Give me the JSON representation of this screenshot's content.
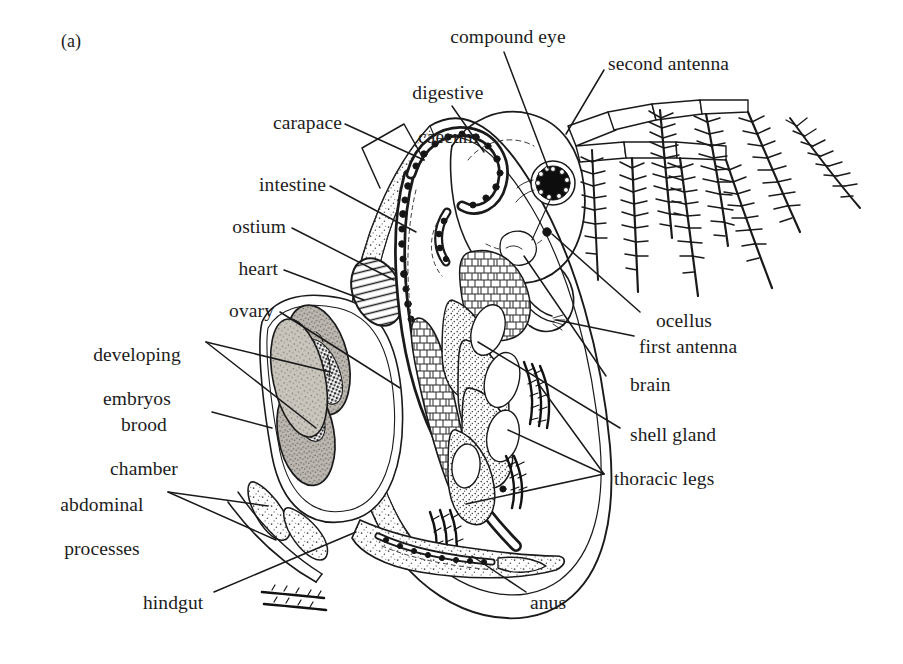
{
  "figure": {
    "panel_id": "(a)",
    "ink_color": "#1a1a1a",
    "background_color": "#ffffff",
    "embryo_fill": "#a8a49d",
    "ovary_fill": "#b5b0a8"
  },
  "labels": {
    "carapace": "carapace",
    "intestine": "intestine",
    "ostium": "ostium",
    "heart": "heart",
    "ovary": "ovary",
    "developing_embryos_line1": "developing",
    "developing_embryos_line2": "embryos",
    "brood_chamber_line1": "brood",
    "brood_chamber_line2": "chamber",
    "abdominal_processes_line1": "abdominal",
    "abdominal_processes_line2": "processes",
    "hindgut": "hindgut",
    "digestive_caecum_line1": "digestive",
    "digestive_caecum_line2": "caecum",
    "compound_eye": "compound eye",
    "second_antenna": "second antenna",
    "ocellus": "ocellus",
    "first_antenna": "first antenna",
    "brain": "brain",
    "shell_gland": "shell gland",
    "thoracic_legs": "thoracic legs",
    "anus": "anus"
  }
}
